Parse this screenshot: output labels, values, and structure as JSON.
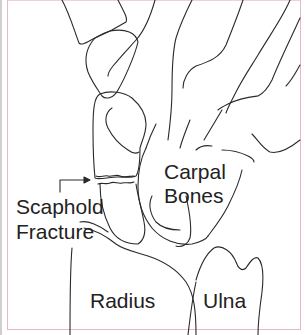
{
  "diagram": {
    "type": "anatomical line illustration",
    "labels": {
      "carpal_line1": "Carpal",
      "carpal_line2": "Bones",
      "scaphoid_line1": "Scaphold",
      "scaphoid_line2": "Fracture",
      "radius": "Radius",
      "ulna": "Ulna"
    },
    "colors": {
      "line": "#2a2a2a",
      "border": "#e8b8c8",
      "background": "#ffffff"
    }
  }
}
